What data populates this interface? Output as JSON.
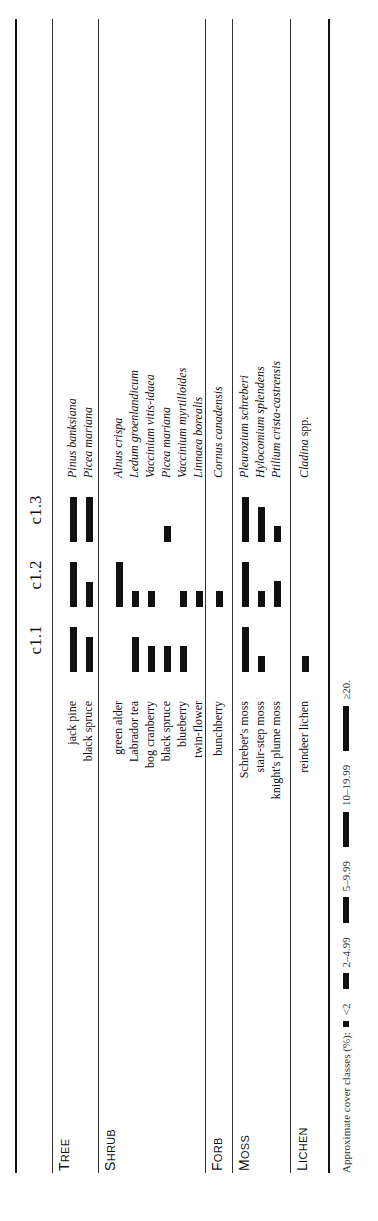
{
  "table": {
    "columns": [
      "c1.1",
      "c1.2",
      "c1.3"
    ],
    "groups": [
      {
        "category_initial": "T",
        "category_rest": "REE",
        "rows": [
          {
            "common": "jack pine",
            "latin": "Pinus banksiana",
            "cover": [
              ">=20",
              ">=20",
              ">=20"
            ]
          },
          {
            "common": "black spruce",
            "latin": "Picea mariana",
            "cover": [
              "10-19.99",
              "5-9.99",
              ">=20"
            ]
          }
        ]
      },
      {
        "category_initial": "S",
        "category_rest": "HRUB",
        "rows": [
          {
            "common": "green alder",
            "latin": "Alnus crispa",
            "cover": [
              null,
              ">=20",
              null
            ]
          },
          {
            "common": "Labrador tea",
            "latin": "Ledum groenlandicum",
            "cover": [
              "10-19.99",
              "2-4.99",
              null
            ]
          },
          {
            "common": "bog cranberry",
            "latin": "Vaccinium vitis-idaea",
            "cover": [
              "5-9.99",
              "2-4.99",
              null
            ]
          },
          {
            "common": "black spruce",
            "latin": "Picea mariana",
            "cover": [
              "5-9.99",
              null,
              "2-4.99"
            ]
          },
          {
            "common": "blueberry",
            "latin": "Vaccinium myrtilloides",
            "cover": [
              "5-9.99",
              "2-4.99",
              null
            ]
          },
          {
            "common": "twin-flower",
            "latin": "Linnaea borealis",
            "cover": [
              null,
              "2-4.99",
              null
            ]
          }
        ]
      },
      {
        "category_initial": "F",
        "category_rest": "ORB",
        "rows": [
          {
            "common": "bunchberry",
            "latin": "Cornus canadensis",
            "cover": [
              null,
              "2-4.99",
              null
            ]
          }
        ]
      },
      {
        "category_initial": "M",
        "category_rest": "OSS",
        "rows": [
          {
            "common": "Schreber's moss",
            "latin": "Pleurozium schreberi",
            "cover": [
              ">=20",
              ">=20",
              ">=20"
            ]
          },
          {
            "common": "stair-step moss",
            "latin": "Hylocomium splendens",
            "cover": [
              "2-4.99",
              "2-4.99",
              "10-19.99"
            ]
          },
          {
            "common": "knight's plume moss",
            "latin": "Ptilium crista-castrensis",
            "cover": [
              null,
              "5-9.99",
              "2-4.99"
            ]
          }
        ]
      },
      {
        "category_initial": "L",
        "category_rest": "ICHEN",
        "rows": [
          {
            "common": "reindeer lichen",
            "latin_italic": "Cladina",
            "latin_roman": " spp.",
            "cover": [
              "2-4.99",
              null,
              null
            ]
          }
        ]
      }
    ]
  },
  "legend": {
    "label": "Approximate cover classes (%):",
    "classes": [
      "<2",
      "2–4.99",
      "5–9.99",
      "10–19.99",
      "≥20."
    ]
  }
}
